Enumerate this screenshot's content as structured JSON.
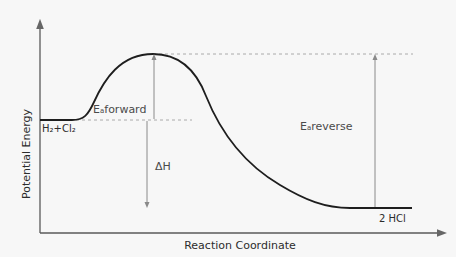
{
  "diagram": {
    "axes": {
      "y_label": "Potential Energy",
      "x_label": "Reaction Coordinate"
    },
    "labels": {
      "reactants": "H₂+Cl₂",
      "products": "2 HCl",
      "ea_forward": "Eₐforward",
      "ea_reverse": "Eₐreverse",
      "delta_h": "ΔH"
    },
    "levels": {
      "reactant_energy": "high",
      "transition_state": "peak",
      "product_energy": "low",
      "reaction_type": "exothermic"
    },
    "colors": {
      "curve": "#1e1e1e",
      "axes": "#555555",
      "guides": "#aaaaaa",
      "arrows": "#8a8a8a",
      "text": "#4a4a4a",
      "background": "#f7f7f7"
    }
  }
}
